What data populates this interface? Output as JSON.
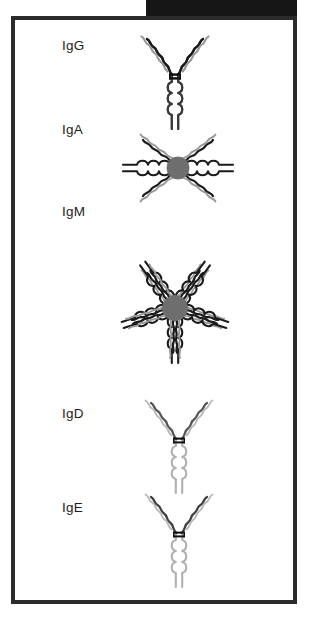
{
  "figure": {
    "background_color": "#ffffff",
    "frame_color": "#2b2b2b",
    "top_bar": {
      "name": "black-header-bar",
      "color": "#161616",
      "text": ""
    },
    "colors": {
      "heavy_chain_dark": "#1b1b1b",
      "heavy_chain_mid": "#4a4a4a",
      "light_chain_gray": "#9a9a9a",
      "light_chain_light": "#b8b8b8",
      "stem_light": "#b0b0b0",
      "j_chain_circle": "#6e6e6e",
      "disulfide_bond": "#111111",
      "label_text": "#1d1d1d"
    },
    "isotypes": [
      {
        "id": "igg",
        "label": "IgG",
        "form": "monomer",
        "units": 1,
        "label_x": 58,
        "label_y": 34,
        "center_x": 171,
        "center_y": 50,
        "arm_color": "#1b1b1b",
        "light_color": "#9a9a9a",
        "stem_color": "#3a3a3a",
        "has_j_chain": false
      },
      {
        "id": "iga",
        "label": "IgA",
        "form": "dimer",
        "units": 2,
        "label_x": 58,
        "label_y": 118,
        "center_x": 174,
        "center_y": 158,
        "arm_color": "#1b1b1b",
        "light_color": "#9a9a9a",
        "stem_color": "#1b1b1b",
        "has_j_chain": true
      },
      {
        "id": "igm",
        "label": "IgM",
        "form": "pentamer",
        "units": 5,
        "label_x": 58,
        "label_y": 200,
        "center_x": 171,
        "center_y": 296,
        "arm_color": "#1b1b1b",
        "light_color": "#9a9a9a",
        "stem_color": "#1b1b1b",
        "has_j_chain": true
      },
      {
        "id": "igd",
        "label": "IgD",
        "form": "monomer",
        "units": 1,
        "label_x": 58,
        "label_y": 402,
        "center_x": 175,
        "center_y": 418,
        "arm_color": "#555555",
        "light_color": "#b8b8b8",
        "stem_color": "#b0b0b0",
        "has_j_chain": false
      },
      {
        "id": "ige",
        "label": "IgE",
        "form": "monomer",
        "units": 1,
        "label_x": 58,
        "label_y": 496,
        "center_x": 175,
        "center_y": 512,
        "arm_color": "#3f3f3f",
        "light_color": "#b8b8b8",
        "stem_color": "#b0b0b0",
        "has_j_chain": false
      }
    ]
  }
}
